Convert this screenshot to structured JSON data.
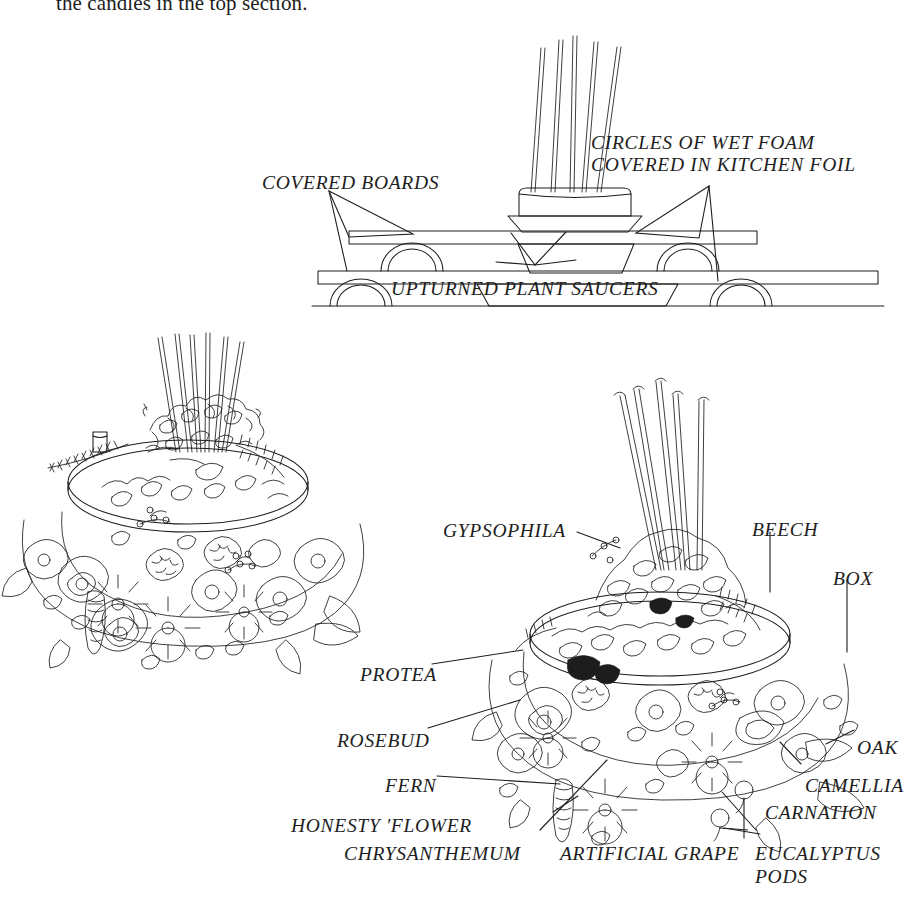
{
  "page": {
    "width": 893,
    "height": 905,
    "background_color": "#ffffff",
    "ink_color": "#1d1d1d",
    "body_text": "the candles in the top section."
  },
  "cross_section_diagram": {
    "name": "tiered-stand-cross-section",
    "labels": [
      {
        "id": "covered-boards",
        "text": "COVERED BOARDS",
        "x": 262,
        "y": 172
      },
      {
        "id": "circles-of-wet-foam",
        "text": "CIRCLES OF WET FOAM",
        "x": 591,
        "y": 132
      },
      {
        "id": "covered-in-kitchen-foil",
        "text": "COVERED IN KITCHEN FOIL",
        "x": 591,
        "y": 154
      },
      {
        "id": "upturned-plant-saucers",
        "text": "UPTURNED PLANT SAUCERS",
        "x": 391,
        "y": 278
      }
    ],
    "candle_count": 5
  },
  "left_illustration": {
    "name": "finished-arrangement-plain",
    "candle_count": 6
  },
  "right_illustration": {
    "name": "finished-arrangement-labelled",
    "candle_count": 5,
    "labels": [
      {
        "id": "gypsophila",
        "text": "GYPSOPHILA",
        "x": 443,
        "y": 520
      },
      {
        "id": "beech",
        "text": "BEECH",
        "x": 752,
        "y": 519
      },
      {
        "id": "box",
        "text": "BOX",
        "x": 833,
        "y": 568
      },
      {
        "id": "protea",
        "text": "PROTEA",
        "x": 360,
        "y": 664
      },
      {
        "id": "rosebud",
        "text": "ROSEBUD",
        "x": 337,
        "y": 730
      },
      {
        "id": "oak",
        "text": "OAK",
        "x": 857,
        "y": 737
      },
      {
        "id": "fern",
        "text": "FERN",
        "x": 385,
        "y": 775
      },
      {
        "id": "camellia",
        "text": "CAMELLIA",
        "x": 805,
        "y": 775
      },
      {
        "id": "carnation",
        "text": "CARNATION",
        "x": 765,
        "y": 802
      },
      {
        "id": "honesty-flower",
        "text": "HONESTY 'FLOWER",
        "x": 291,
        "y": 815
      },
      {
        "id": "eucalyptus",
        "text": "EUCALYPTUS",
        "x": 755,
        "y": 843
      },
      {
        "id": "pods",
        "text": "PODS",
        "x": 755,
        "y": 866
      },
      {
        "id": "chrysanthemum",
        "text": "CHRYSANTHEMUM",
        "x": 344,
        "y": 843
      },
      {
        "id": "artificial-grape",
        "text": "ARTIFICIAL GRAPE",
        "x": 560,
        "y": 843
      }
    ]
  }
}
